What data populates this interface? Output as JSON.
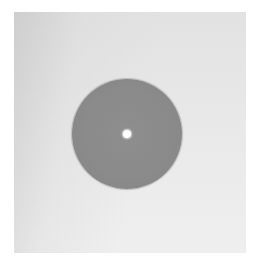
{
  "caption": {
    "text": "",
    "note_visible": "cropped, illegible text fragment at top edge"
  },
  "photo": {
    "subject": "gray disc with small central hole on light paper background",
    "colors": {
      "background_left": "#d8d8d8",
      "background_right": "#eeeeee",
      "disc": "#8a8a8a",
      "hole": "#ffffff"
    }
  }
}
